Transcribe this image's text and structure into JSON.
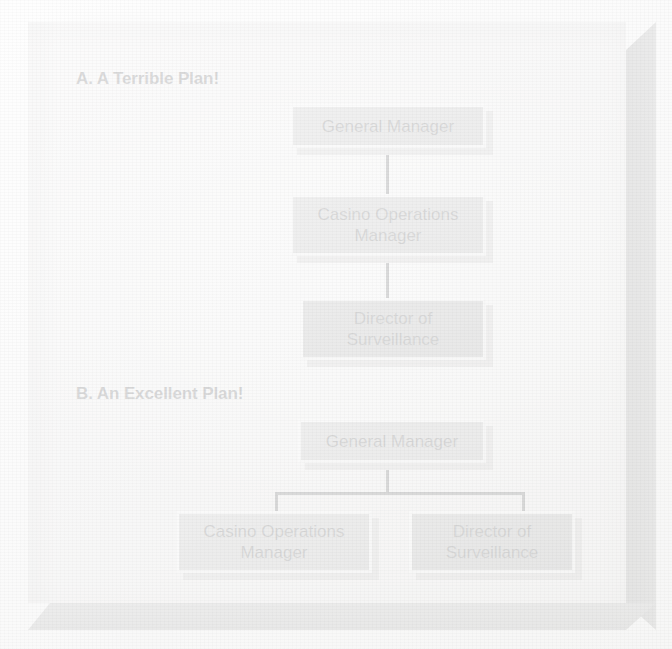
{
  "figure": {
    "background_color": "#fdfdfd",
    "panel_color": "#f5f5f4",
    "bevel_color": "#949494"
  },
  "sections": [
    {
      "id": "plan-a",
      "heading": "A. A Terrible Plan!",
      "layout": "vertical-chain",
      "nodes": [
        {
          "id": "a-general-manager",
          "label": "General Manager",
          "tone": "light"
        },
        {
          "id": "a-casino-operations",
          "label": "Casino Operations\nManager",
          "tone": "light"
        },
        {
          "id": "a-director-surveillance",
          "label": "Director of\nSurveillance",
          "tone": "dark"
        }
      ]
    },
    {
      "id": "plan-b",
      "heading": "B. An Excellent Plan!",
      "layout": "tree-two-children",
      "nodes": [
        {
          "id": "b-general-manager",
          "label": "General Manager",
          "tone": "light"
        },
        {
          "id": "b-casino-operations",
          "label": "Casino Operations\nManager",
          "tone": "light"
        },
        {
          "id": "b-director-surveillance",
          "label": "Director of\nSurveillance",
          "tone": "dark"
        }
      ]
    }
  ],
  "colors": {
    "box_light": "#a6a6a6",
    "box_dark": "#919191",
    "box_shadow": "#b4b2b0",
    "box_highlight": "#fbfbfb",
    "connector": "#232427",
    "text": "#1b1c1e"
  }
}
